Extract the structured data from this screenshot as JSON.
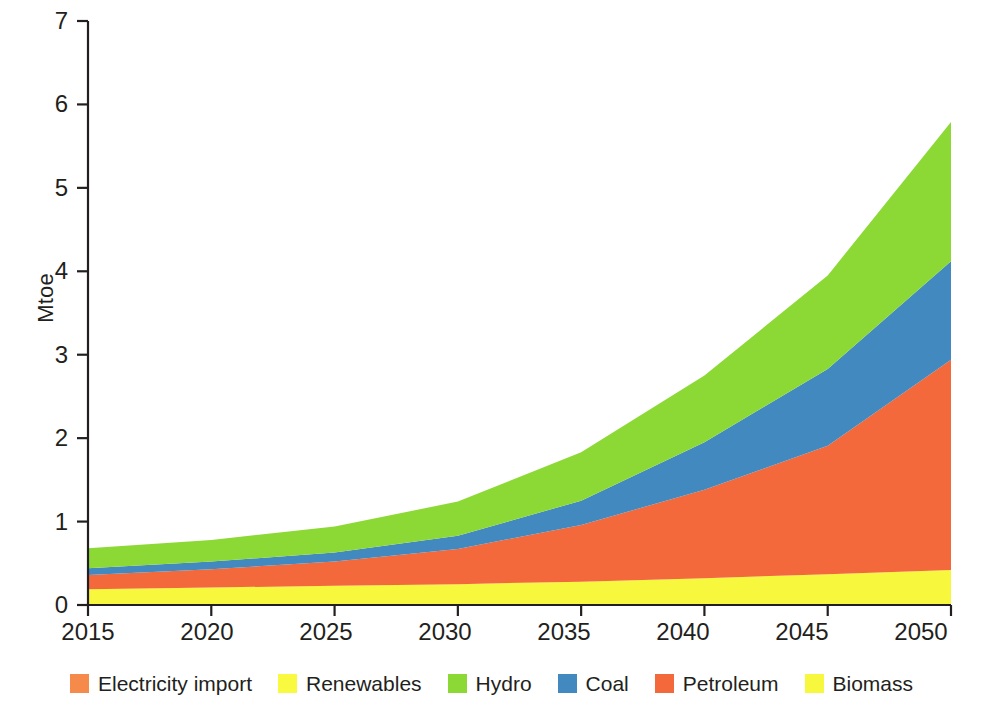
{
  "chart_data": {
    "type": "area",
    "title": "",
    "subtitle": "",
    "xlabel": "",
    "ylabel": "Mtoe",
    "stacked": true,
    "grid": false,
    "legend_position": "bottom",
    "xlim": [
      2015,
      2050
    ],
    "ylim": [
      0,
      7
    ],
    "x": [
      2015,
      2020,
      2025,
      2030,
      2035,
      2040,
      2045,
      2050
    ],
    "xtick_labels": [
      "2015",
      "2020",
      "2025",
      "2030",
      "2035",
      "2040",
      "2045",
      "2050"
    ],
    "ytick_labels": [
      "0",
      "1",
      "2",
      "3",
      "4",
      "5",
      "6",
      "7"
    ],
    "ytick_values": [
      0,
      1,
      2,
      3,
      4,
      5,
      6,
      7
    ],
    "stack_order_bottom_to_top": [
      "Biomass",
      "Petroleum",
      "Coal",
      "Hydro",
      "Renewables",
      "Electricity import"
    ],
    "series": [
      {
        "name": "Biomass",
        "color": "#F7F73E",
        "values": [
          0.19,
          0.21,
          0.23,
          0.25,
          0.28,
          0.32,
          0.37,
          0.42
        ]
      },
      {
        "name": "Petroleum",
        "color": "#F4693C",
        "values": [
          0.17,
          0.22,
          0.29,
          0.42,
          0.68,
          1.06,
          1.54,
          2.52
        ]
      },
      {
        "name": "Coal",
        "color": "#4189BE",
        "values": [
          0.08,
          0.09,
          0.11,
          0.16,
          0.29,
          0.57,
          0.92,
          1.18
        ]
      },
      {
        "name": "Hydro",
        "color": "#8CD936",
        "values": [
          0.24,
          0.26,
          0.31,
          0.41,
          0.58,
          0.8,
          1.12,
          1.67
        ]
      },
      {
        "name": "Renewables",
        "color": "#F9F93F",
        "values": [
          0.0,
          0.0,
          0.0,
          0.0,
          0.0,
          0.0,
          0.0,
          0.0
        ]
      },
      {
        "name": "Electricity import",
        "color": "#F58A4B",
        "values": [
          0.0,
          0.0,
          0.0,
          0.0,
          0.0,
          0.0,
          0.0,
          0.0
        ]
      }
    ],
    "totals": [
      0.68,
      0.78,
      0.94,
      1.24,
      1.83,
      2.75,
      3.95,
      5.79
    ]
  },
  "axes": {
    "ylabel": "Mtoe",
    "yticks": [
      {
        "label": "7",
        "value": 7
      },
      {
        "label": "6",
        "value": 6
      },
      {
        "label": "5",
        "value": 5
      },
      {
        "label": "4",
        "value": 4
      },
      {
        "label": "3",
        "value": 3
      },
      {
        "label": "2",
        "value": 2
      },
      {
        "label": "1",
        "value": 1
      },
      {
        "label": "0",
        "value": 0
      }
    ],
    "xticks": [
      {
        "label": "2015",
        "value": 2015
      },
      {
        "label": "2020",
        "value": 2020
      },
      {
        "label": "2025",
        "value": 2025
      },
      {
        "label": "2030",
        "value": 2030
      },
      {
        "label": "2035",
        "value": 2035
      },
      {
        "label": "2040",
        "value": 2040
      },
      {
        "label": "2045",
        "value": 2045
      },
      {
        "label": "2050",
        "value": 2050
      }
    ]
  },
  "legend": {
    "items": [
      {
        "label": "Electricity import",
        "color": "#F58A4B"
      },
      {
        "label": "Renewables",
        "color": "#F9F93F"
      },
      {
        "label": "Hydro",
        "color": "#8CD936"
      },
      {
        "label": "Coal",
        "color": "#4189BE"
      },
      {
        "label": "Petroleum",
        "color": "#F4693C"
      },
      {
        "label": "Biomass",
        "color": "#F7F73E"
      }
    ]
  },
  "colors": {
    "axis": "#231f20",
    "background": "#ffffff",
    "electricity_import": "#F58A4B",
    "renewables": "#F9F93F",
    "hydro": "#8CD936",
    "coal": "#4189BE",
    "petroleum": "#F4693C",
    "biomass": "#F7F73E"
  }
}
